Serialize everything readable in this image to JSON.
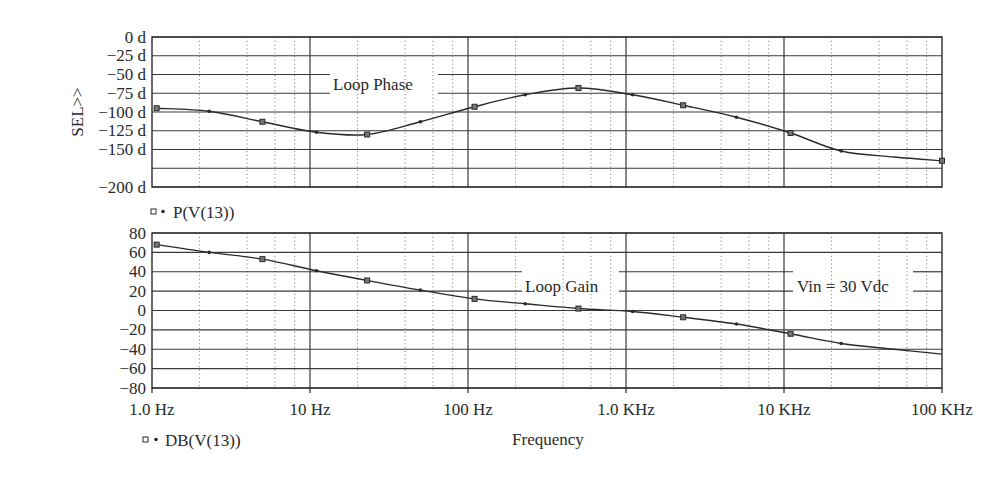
{
  "chart_data": [
    {
      "type": "line",
      "title": "Loop Phase",
      "ylabel": "SEL>>",
      "xlabel": "",
      "x_scale": "log",
      "xlim": [
        1,
        100000
      ],
      "ylim": [
        -200,
        0
      ],
      "y_ticks": [
        0,
        -25,
        -50,
        -75,
        -100,
        -125,
        -150,
        -175,
        -200
      ],
      "y_tick_labels": [
        "0 d",
        "−25 d",
        "−50 d",
        "−75 d",
        "−100 d",
        "−125 d",
        "−150 d",
        "",
        "−200 d"
      ],
      "grid": true,
      "legend": [
        {
          "label": "P(V(13))",
          "markers": [
            "square",
            "dot"
          ]
        }
      ],
      "annotation": {
        "text": "Loop Phase",
        "x_px": [
          330,
          438
        ],
        "between_y": [
          -50,
          -75
        ]
      },
      "series": [
        {
          "name": "P(V(13))",
          "x": [
            1.07,
            2.3,
            5.0,
            11,
            23,
            50,
            110,
            230,
            500,
            1100,
            2300,
            5000,
            11000,
            23000,
            50000,
            100000
          ],
          "y": [
            -95,
            -99,
            -113,
            -127,
            -130,
            -113,
            -93,
            -77,
            -68,
            -77,
            -91,
            -107,
            -128,
            -152,
            -160,
            -165
          ],
          "markers_at": [
            0,
            1,
            2,
            3,
            4,
            5,
            6,
            7,
            8,
            9,
            10,
            11,
            12,
            13,
            15
          ]
        }
      ]
    },
    {
      "type": "line",
      "title": "Loop Gain",
      "ylabel": "",
      "xlabel": "Frequency",
      "x_scale": "log",
      "xlim": [
        1,
        100000
      ],
      "ylim": [
        -80,
        80
      ],
      "y_ticks": [
        80,
        60,
        40,
        20,
        0,
        -20,
        -40,
        -60,
        -80
      ],
      "y_tick_labels": [
        "80",
        "60",
        "40",
        "20",
        "0",
        "−20",
        "−40",
        "−60",
        "−80"
      ],
      "x_ticks": [
        1,
        10,
        100,
        1000,
        10000,
        100000
      ],
      "x_tick_labels": [
        "1.0 Hz",
        "10 Hz",
        "100 Hz",
        "1.0 KHz",
        "10 KHz",
        "100 KHz"
      ],
      "grid": true,
      "legend": [
        {
          "label": "DB(V(13))",
          "markers": [
            "square",
            "dot"
          ]
        }
      ],
      "annotations": [
        {
          "text": "Loop Gain",
          "x_px": [
            522,
            619
          ],
          "between_y": [
            40,
            20
          ]
        },
        {
          "text": "Vin = 30 Vdc",
          "x_px": [
            793,
            913
          ],
          "between_y": [
            40,
            20
          ]
        }
      ],
      "series": [
        {
          "name": "DB(V(13))",
          "x": [
            1.07,
            2.3,
            5.0,
            11,
            23,
            50,
            110,
            230,
            500,
            1100,
            2300,
            5000,
            11000,
            23000,
            50000,
            100000
          ],
          "y": [
            68,
            60,
            53,
            41,
            31,
            21,
            12,
            7,
            2,
            -1,
            -7,
            -14,
            -24,
            -34,
            -40,
            -45
          ],
          "markers_at": [
            0,
            1,
            2,
            3,
            4,
            5,
            6,
            7,
            8,
            9,
            10,
            11,
            12,
            13
          ]
        }
      ]
    }
  ],
  "labels": {
    "phase_ylabel": "SEL>>",
    "phase_legend": "P(V(13))",
    "gain_legend": "DB(V(13))",
    "phase_annotation": "Loop Phase",
    "gain_annotation": "Loop Gain",
    "vin_annotation": "Vin = 30 Vdc",
    "xlabel": "Frequency"
  },
  "colors": {
    "axis": "#2b2b2b",
    "grid_major": "#3a3a3a",
    "grid_minor": "#8a8a8a",
    "trace": "#2a2a2a",
    "background": "#ffffff"
  }
}
